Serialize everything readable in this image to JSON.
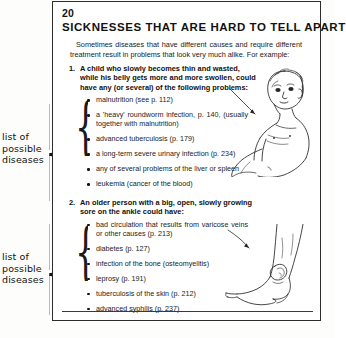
{
  "book_page": {
    "number": "20",
    "title": "SICKNESSES THAT ARE HARD TO TELL APART",
    "intro": "Sometimes diseases that have different causes and require different treatment result in problems that look very much alike. For example:",
    "items": [
      {
        "number": "1.",
        "heading": "A child who slowly becomes thin and wasted, while his belly gets more and more swollen, could have any (or several) of the following problems:",
        "bullets": [
          "malnutrition (see p. 112)",
          "a 'heavy' roundworm infection, p. 140, (usually together with malnutrition)",
          "advanced tuberculosis (p. 179)",
          "a long-term severe urinary infection (p. 234)",
          "any of several problems of the liver or spleen",
          "leukemia (cancer of the blood)"
        ]
      },
      {
        "number": "2.",
        "heading": "An older person with a big, open, slowly growing sore on the ankle could have:",
        "bullets": [
          "bad circulation that results from varicose veins or other causes (p. 213)",
          "diabetes (p. 127)",
          "infection of the bone (osteomyelitis)",
          "leprosy (p. 191)",
          "tuberculosis of the skin (p. 212)",
          "advanced syphilis (p. 237)"
        ]
      }
    ],
    "illustrations": [
      {
        "name": "child-with-swollen-belly-illustration",
        "alt": "line drawing of a thin child with a swollen belly"
      },
      {
        "name": "ankle-with-open-sore-illustration",
        "alt": "line drawing of a leg and ankle with an open sore"
      }
    ],
    "bottom_caption": ""
  },
  "margin_notes": [
    {
      "text": "list of possible diseases",
      "brace": "{"
    },
    {
      "text": "list of possible diseases",
      "brace": "{"
    }
  ]
}
